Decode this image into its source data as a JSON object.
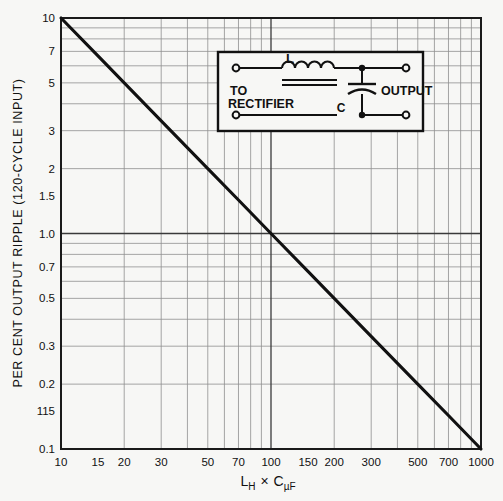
{
  "figure": {
    "kind": "log-log-nomograph",
    "paper_color": "#f7f7f5",
    "ink_color": "#1a1a1a",
    "grid_color": "#4a4a4a",
    "grid_minor_color": "#8c8c8c"
  },
  "axes": {
    "y_title": "PER CENT OUTPUT RIPPLE (120-CYCLE INPUT)",
    "x_title_parts": {
      "l": "L",
      "l_sub": "H",
      "times": "×",
      "c": "C",
      "c_sub": "µF"
    },
    "x_title_plain": "Lₕ × CµF"
  },
  "inset": {
    "label_to": "TO",
    "label_rectifier": "RECTIFIER",
    "label_output": "OUTPUT",
    "label_inductor": "L",
    "label_capacitor": "C"
  },
  "chart_data": {
    "type": "line",
    "title": "",
    "subtitle": "",
    "xlabel": "L_H x C_uF",
    "ylabel": "PER CENT OUTPUT RIPPLE (120-CYCLE INPUT)",
    "xscale": "log",
    "yscale": "log",
    "xlim": [
      10,
      1000
    ],
    "ylim": [
      0.1,
      10
    ],
    "grid": true,
    "legend": null,
    "xticks": [
      10,
      15,
      20,
      30,
      50,
      70,
      100,
      150,
      200,
      300,
      500,
      700,
      1000
    ],
    "xticklabels": [
      "10",
      "15",
      "20",
      "30",
      "50",
      "70",
      "100",
      "150",
      "200",
      "300",
      "500",
      "700",
      "1000"
    ],
    "yticks": [
      10,
      7,
      5,
      3,
      2,
      1.5,
      1.0,
      0.7,
      0.5,
      0.3,
      0.2,
      0.15,
      0.1
    ],
    "yticklabels": [
      "10",
      "7",
      "5",
      "3",
      "2",
      "1.5",
      "1.0",
      "0.7",
      "0.5",
      "0.3",
      "0.2",
      "115",
      "0.1"
    ],
    "series": [
      {
        "name": "ripple",
        "x": [
          10,
          15,
          20,
          30,
          50,
          70,
          100,
          150,
          200,
          300,
          500,
          700,
          1000
        ],
        "y": [
          10,
          6.67,
          5.0,
          3.33,
          2.0,
          1.43,
          1.0,
          0.667,
          0.5,
          0.333,
          0.2,
          0.143,
          0.1
        ]
      }
    ],
    "annotations": []
  }
}
